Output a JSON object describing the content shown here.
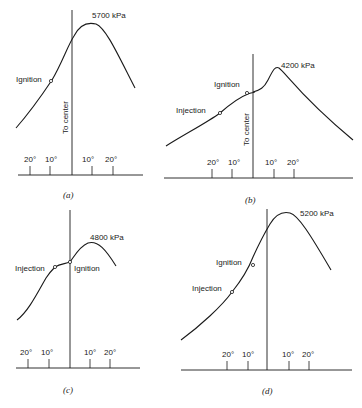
{
  "panels": [
    {
      "id": "a",
      "caption": "(a)",
      "peak_label": "5700 kPa",
      "center_label": "To center",
      "markers": [
        {
          "label": "Ignition"
        }
      ],
      "tick_labels": {
        "left": [
          "20°",
          "10°"
        ],
        "right": [
          "10°",
          "20°"
        ]
      }
    },
    {
      "id": "b",
      "caption": "(b)",
      "peak_label": "4200 kPa",
      "center_label": "To center",
      "markers": [
        {
          "label": "Injection"
        },
        {
          "label": "Ignition"
        }
      ],
      "tick_labels": {
        "left": [
          "20°",
          "10°"
        ],
        "right": [
          "10°",
          "20°"
        ]
      }
    },
    {
      "id": "c",
      "caption": "(c)",
      "peak_label": "4800 kPa",
      "markers": [
        {
          "label": "Injection"
        },
        {
          "label": "Ignition"
        }
      ],
      "tick_labels": {
        "left": [
          "20°",
          "10°"
        ],
        "right": [
          "10°",
          "20°"
        ]
      }
    },
    {
      "id": "d",
      "caption": "(d)",
      "peak_label": "5200 kPa",
      "markers": [
        {
          "label": "Injection"
        },
        {
          "label": "Ignition"
        }
      ],
      "tick_labels": {
        "left": [
          "20°",
          "10°"
        ],
        "right": [
          "10°",
          "20°"
        ]
      }
    }
  ]
}
